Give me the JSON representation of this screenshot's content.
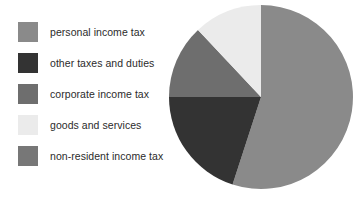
{
  "legend": {
    "position": "left",
    "items": [
      {
        "label": "personal income tax",
        "color": "#8a8a8a"
      },
      {
        "label": "other taxes and duties",
        "color": "#333333"
      },
      {
        "label": "corporate income tax",
        "color": "#6e6e6e"
      },
      {
        "label": "goods and services",
        "color": "#ebebeb"
      },
      {
        "label": "non-resident income tax",
        "color": "#777777"
      }
    ]
  },
  "chart_data": {
    "type": "pie",
    "title": "",
    "subtitle": "",
    "xlabel": "",
    "ylabel": "",
    "grid": false,
    "legend_position": "left",
    "start_angle_deg": 0,
    "direction": "clockwise",
    "categories": [
      "personal income tax",
      "other taxes and duties",
      "corporate income tax",
      "goods and services",
      "non-resident income tax"
    ],
    "values": [
      55,
      20,
      13,
      12,
      0
    ],
    "colors": [
      "#8a8a8a",
      "#333333",
      "#6e6e6e",
      "#ebebeb",
      "#777777"
    ],
    "slice_angles_deg": [
      198,
      72,
      47,
      43,
      0
    ],
    "annotations": []
  },
  "pie_geometry": {
    "center_x": 261,
    "center_y": 97,
    "radius": 92
  },
  "colors": {
    "background": "#ffffff",
    "text": "#2b2b2b"
  }
}
